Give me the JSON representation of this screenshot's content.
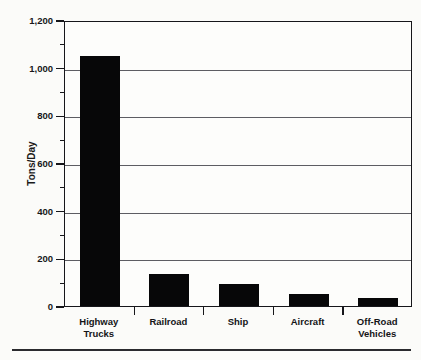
{
  "chart_data": {
    "type": "bar",
    "title": "",
    "xlabel": "",
    "ylabel": "Tons/Day",
    "categories": [
      "Highway Trucks",
      "Railroad",
      "Ship",
      "Aircraft",
      "Off-Road Vehicles"
    ],
    "category_lines": [
      [
        "Highway",
        "Trucks"
      ],
      [
        "Railroad"
      ],
      [
        "Ship"
      ],
      [
        "Aircraft"
      ],
      [
        "Off-Road",
        "Vehicles"
      ]
    ],
    "values": [
      1050,
      133,
      92,
      52,
      32
    ],
    "ylim": [
      0,
      1200
    ],
    "ytick_values": [
      0,
      200,
      400,
      600,
      800,
      1000,
      1200
    ],
    "ytick_labels": [
      "0",
      "200",
      "400",
      "600",
      "800",
      "1,000",
      "1,200"
    ],
    "yminor_values": [
      100,
      300,
      500,
      700,
      900,
      1100
    ],
    "grid": true,
    "grid_axis": "y",
    "legend": false,
    "bar_color": "#070708",
    "axis_color": "#16161a",
    "grid_color": "#5d5d62",
    "background_color": "#fbfbf9"
  }
}
